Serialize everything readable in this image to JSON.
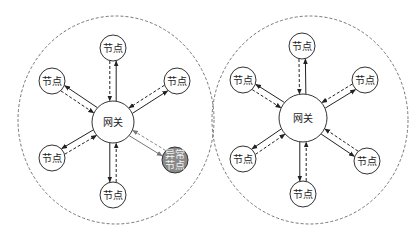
{
  "diagrams": [
    {
      "gateway": {
        "label": "网关",
        "cx": 113,
        "cy": 122,
        "r": 21
      },
      "boundary": {
        "cx": 116,
        "cy": 120,
        "rx": 98,
        "ry": 104
      },
      "nodes": [
        {
          "label": "节点",
          "cx": 113,
          "cy": 48,
          "abnormal": false
        },
        {
          "label": "节点",
          "cx": 52,
          "cy": 81,
          "abnormal": false
        },
        {
          "label": "节点",
          "cx": 177,
          "cy": 81,
          "abnormal": false
        },
        {
          "label": "节点",
          "cx": 52,
          "cy": 158,
          "abnormal": false
        },
        {
          "label": "异常\n节点",
          "cx": 175,
          "cy": 160,
          "abnormal": true
        },
        {
          "label": "节点",
          "cx": 113,
          "cy": 195,
          "abnormal": false
        }
      ]
    },
    {
      "gateway": {
        "label": "网关",
        "cx": 303,
        "cy": 118,
        "r": 24
      },
      "boundary": {
        "cx": 310,
        "cy": 120,
        "rx": 98,
        "ry": 104
      },
      "nodes": [
        {
          "label": "节点",
          "cx": 302,
          "cy": 46,
          "abnormal": false
        },
        {
          "label": "节点",
          "cx": 243,
          "cy": 80,
          "abnormal": false
        },
        {
          "label": "节点",
          "cx": 365,
          "cy": 80,
          "abnormal": false
        },
        {
          "label": "节点",
          "cx": 243,
          "cy": 159,
          "abnormal": false
        },
        {
          "label": "节点",
          "cx": 367,
          "cy": 161,
          "abnormal": false
        },
        {
          "label": "节点",
          "cx": 303,
          "cy": 194,
          "abnormal": false
        }
      ]
    }
  ],
  "colors": {
    "stroke": "#333333",
    "abnormal_fill": "#8a8a8a",
    "dashed": "#555555"
  },
  "node_radius": 13
}
